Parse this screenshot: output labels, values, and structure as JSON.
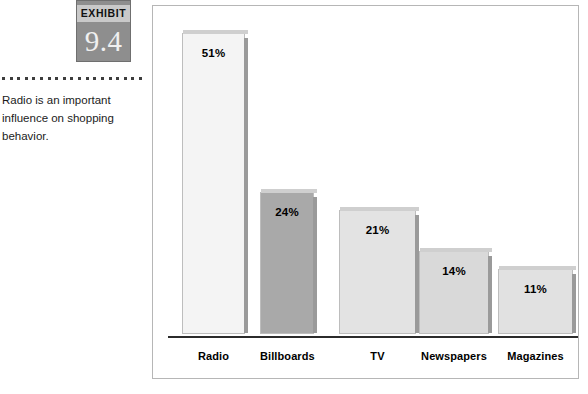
{
  "exhibit": {
    "word": "EXHIBIT",
    "number": "9.4"
  },
  "caption": {
    "text": "Radio is an important influence on shopping behavior."
  },
  "chart_data": {
    "type": "bar",
    "title": "",
    "xlabel": "",
    "ylabel": "",
    "ylim": [
      0,
      55
    ],
    "grid": false,
    "legend": "none",
    "categories": [
      "Radio",
      "Billboards",
      "TV",
      "Newspapers",
      "Magazines"
    ],
    "values": [
      51,
      24,
      21,
      14,
      11
    ],
    "data_labels": [
      "51%",
      "24%",
      "21%",
      "14%",
      "11%"
    ],
    "bar_colors": [
      "#f4f4f4",
      "#a9a9a9",
      "#e3e3e3",
      "#d9d9d9",
      "#e1e1e1"
    ]
  }
}
